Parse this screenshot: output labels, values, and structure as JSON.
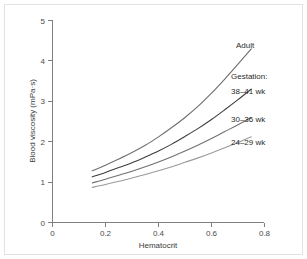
{
  "chart_data": {
    "type": "line",
    "title": "",
    "xlabel": "Hematocrit",
    "ylabel": "Blood viscosity (mPa·s)",
    "xlim": [
      0,
      0.8
    ],
    "ylim": [
      0,
      5
    ],
    "xticks": [
      "0",
      "0.2",
      "0.4",
      "0.6",
      "0.8"
    ],
    "xtick_values": [
      0,
      0.2,
      0.4,
      0.6,
      0.8
    ],
    "yticks": [
      "0",
      "1",
      "2",
      "3",
      "4",
      "5"
    ],
    "ytick_values": [
      0,
      1,
      2,
      3,
      4,
      5
    ],
    "grid": false,
    "legend_position": "right-inline-annotations",
    "group_label": "Gestation:",
    "x": [
      0.15,
      0.2,
      0.25,
      0.3,
      0.35,
      0.4,
      0.45,
      0.5,
      0.55,
      0.6,
      0.65,
      0.7,
      0.75
    ],
    "series": [
      {
        "name": "Adult",
        "color": "#6f6f6f",
        "label": "Adult",
        "values": [
          1.28,
          1.42,
          1.57,
          1.73,
          1.91,
          2.12,
          2.35,
          2.6,
          2.88,
          3.2,
          3.55,
          3.92,
          4.3
        ]
      },
      {
        "name": "38–41 wk",
        "color": "#3d3d3d",
        "label": "38–41 wk",
        "values": [
          1.13,
          1.24,
          1.36,
          1.48,
          1.62,
          1.77,
          1.94,
          2.13,
          2.33,
          2.55,
          2.79,
          3.04,
          3.3
        ]
      },
      {
        "name": "30–36 wk",
        "color": "#707070",
        "label": "30–36 wk",
        "values": [
          0.98,
          1.07,
          1.17,
          1.27,
          1.38,
          1.5,
          1.63,
          1.77,
          1.92,
          2.08,
          2.25,
          2.42,
          2.6
        ]
      },
      {
        "name": "24–29 wk",
        "color": "#9a9a9a",
        "label": "24–29 wk",
        "values": [
          0.87,
          0.94,
          1.02,
          1.1,
          1.19,
          1.28,
          1.38,
          1.49,
          1.6,
          1.72,
          1.85,
          1.98,
          2.12
        ]
      }
    ]
  },
  "figure": {
    "background_color": "#ffffff",
    "frame_color": "#e2e2e2",
    "axis_color": "#808080"
  }
}
